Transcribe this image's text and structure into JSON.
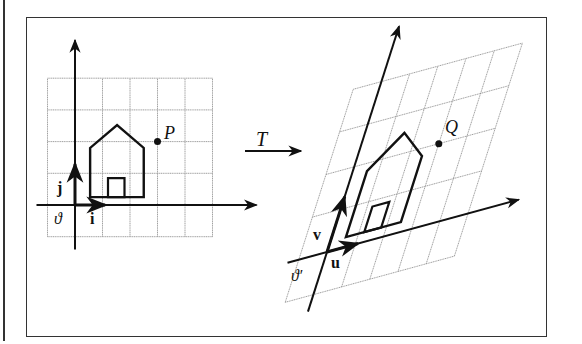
{
  "figure": {
    "transform_label": "T",
    "left_panel": {
      "grid": {
        "cols": 6,
        "rows": 5,
        "col_start": -1,
        "row_start": -1
      },
      "origin_label": "ϑ",
      "basis_x_label": "i",
      "basis_y_label": "j",
      "point_label": "P",
      "point": [
        3,
        2
      ],
      "house": [
        [
          0.55,
          0.25
        ],
        [
          0.55,
          1.8
        ],
        [
          1.53,
          2.52
        ],
        [
          2.5,
          1.8
        ],
        [
          2.5,
          0.25
        ]
      ],
      "door": [
        [
          1.2,
          0.25
        ],
        [
          1.2,
          0.85
        ],
        [
          1.8,
          0.85
        ],
        [
          1.8,
          0.25
        ]
      ]
    },
    "right_panel": {
      "origin_label": "ϑ′",
      "basis_x_label": "u",
      "basis_y_label": "v",
      "point_label": "Q"
    },
    "colors": {
      "ink": "#111111",
      "grid": "#777777",
      "frame": "#333333"
    }
  }
}
